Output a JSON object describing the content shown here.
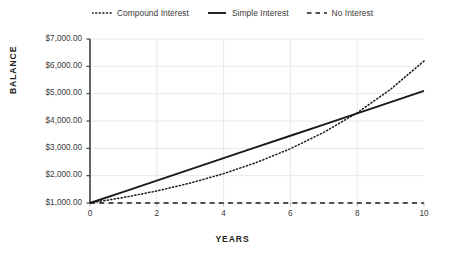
{
  "chart_data": {
    "type": "line",
    "title": "",
    "xlabel": "YEARS",
    "ylabel": "BALANCE",
    "x": [
      0,
      1,
      2,
      3,
      4,
      5,
      6,
      7,
      8,
      9,
      10
    ],
    "xticks": [
      0,
      2,
      4,
      6,
      8,
      10
    ],
    "xtick_labels": [
      "0",
      "2",
      "4",
      "6",
      "8",
      "10"
    ],
    "xlim": [
      0,
      10
    ],
    "ylim": [
      1000,
      7000
    ],
    "yticks": [
      1000,
      2000,
      3000,
      4000,
      5000,
      6000,
      7000
    ],
    "ytick_labels": [
      "$1,000.00",
      "$2,000.00",
      "$3,000.00",
      "$4,000.00",
      "$5,000.00",
      "$6,000.00",
      "$7,000.00"
    ],
    "grid": true,
    "grid_axes": "both",
    "legend_position": "top-center",
    "series": [
      {
        "name": "Compound Interest",
        "style": "dotted",
        "color": "#1a1a1a",
        "values": [
          1000,
          1200,
          1440,
          1728,
          2074,
          2488,
          2986,
          3583,
          4300,
          5160,
          6192
        ]
      },
      {
        "name": "Simple Interest",
        "style": "solid",
        "color": "#1a1a1a",
        "values": [
          1000,
          1410,
          1820,
          2230,
          2640,
          3050,
          3460,
          3870,
          4280,
          4690,
          5100
        ]
      },
      {
        "name": "No Interest",
        "style": "dashed",
        "color": "#1a1a1a",
        "values": [
          1000,
          1000,
          1000,
          1000,
          1000,
          1000,
          1000,
          1000,
          1000,
          1000,
          1000
        ]
      }
    ]
  },
  "legend": {
    "items": [
      {
        "label": "Compound Interest",
        "style": "dotted"
      },
      {
        "label": "Simple Interest",
        "style": "solid"
      },
      {
        "label": "No Interest",
        "style": "dashed"
      }
    ]
  },
  "colors": {
    "background": "#ffffff",
    "line": "#1a1a1a",
    "grid": "#e8e8e8",
    "axis": "#3f3f3f",
    "text": "#231f20"
  }
}
